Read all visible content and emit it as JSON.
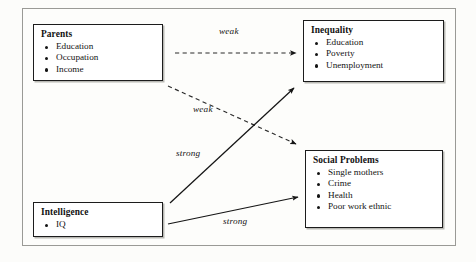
{
  "diagram": {
    "background_color": "#fcfcfa",
    "node_border_color": "#1c1c1c",
    "nodes": [
      {
        "id": "parents",
        "title": "Parents",
        "items": [
          "Education",
          "Occupation",
          "Income"
        ]
      },
      {
        "id": "inequality",
        "title": "Inequality",
        "items": [
          "Education",
          "Poverty",
          "Unemployment"
        ]
      },
      {
        "id": "social_problems",
        "title": "Social Problems",
        "items": [
          "Single mothers",
          "Crime",
          "Health",
          "Poor work ethnic"
        ]
      },
      {
        "id": "intelligence",
        "title": "Intelligence",
        "items": [
          "IQ"
        ]
      }
    ],
    "edges": [
      {
        "id": "parents_to_inequality",
        "label": "weak",
        "from": "parents",
        "to": "inequality",
        "style": "dashed",
        "arrow": "single"
      },
      {
        "id": "parents_to_social",
        "label": "weak",
        "from": "parents",
        "to": "social_problems",
        "style": "dashed",
        "arrow": "single"
      },
      {
        "id": "intelligence_to_inequality",
        "label": "strong",
        "from": "intelligence",
        "to": "inequality",
        "style": "solid",
        "arrow": "single"
      },
      {
        "id": "intelligence_to_social",
        "label": "strong",
        "from": "intelligence",
        "to": "social_problems",
        "style": "solid",
        "arrow": "single"
      }
    ]
  }
}
